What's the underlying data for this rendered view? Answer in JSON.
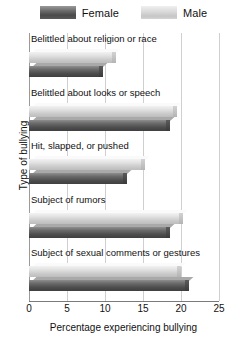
{
  "legend": {
    "position": "top-center",
    "entries": [
      {
        "label": "Female",
        "swatch": "female-swatch",
        "color": "#4d4d4d"
      },
      {
        "label": "Male",
        "swatch": "male-swatch",
        "color": "#d2d2d2"
      }
    ]
  },
  "axes": {
    "ylabel": "Type of bullying",
    "xlabel": "Percentage experiencing bullying",
    "xticks": [
      "0",
      "5",
      "10",
      "15",
      "20",
      "25"
    ]
  },
  "chart_data": {
    "type": "bar",
    "orientation": "horizontal",
    "title": "",
    "xlabel": "Percentage experiencing bullying",
    "ylabel": "Type of bullying",
    "xlim": [
      0,
      25
    ],
    "xticks": [
      0,
      5,
      10,
      15,
      20,
      25
    ],
    "grid": true,
    "legend_position": "top-center",
    "categories": [
      "Belittled about religion or race",
      "Belittled about looks or speech",
      "Hit, slapped, or pushed",
      "Subject of rumors",
      "Subject of sexual comments or gestures"
    ],
    "series": [
      {
        "name": "Female",
        "color": "#4d4d4d",
        "values": [
          9.8,
          18.5,
          12.9,
          18.5,
          21.0
        ]
      },
      {
        "name": "Male",
        "color": "#d2d2d2",
        "values": [
          11.5,
          19.5,
          15.3,
          20.3,
          20.0
        ]
      }
    ]
  }
}
